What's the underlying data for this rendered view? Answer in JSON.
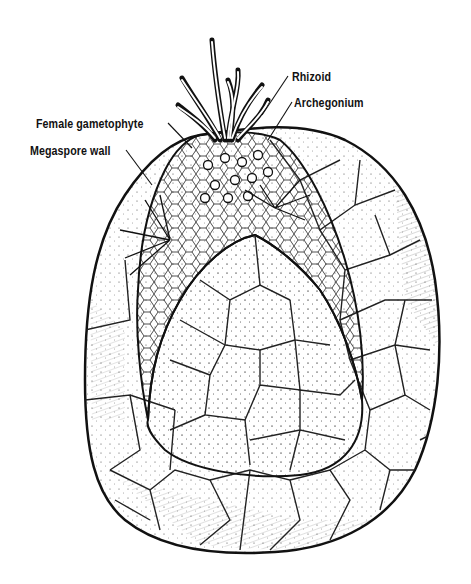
{
  "figure": {
    "colors": {
      "ink": "#111111",
      "background": "#ffffff"
    }
  },
  "labels": {
    "rhizoid": "Rhizoid",
    "archegonium": "Archegonium",
    "female_gametophyte": "Female gametophyte",
    "megaspore_wall": "Megaspore wall"
  }
}
